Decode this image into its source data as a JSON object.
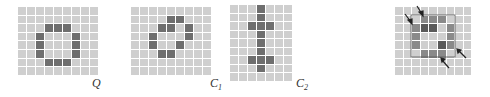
{
  "panels": [
    {
      "id": "Q",
      "label": "Q",
      "label_sub": "",
      "cols": 9,
      "rows": 8,
      "on_cells": [
        [
          2,
          3
        ],
        [
          2,
          4
        ],
        [
          2,
          5
        ],
        [
          3,
          2
        ],
        [
          3,
          6
        ],
        [
          4,
          2
        ],
        [
          4,
          6
        ],
        [
          5,
          2
        ],
        [
          5,
          6
        ],
        [
          6,
          3
        ],
        [
          6,
          4
        ],
        [
          6,
          5
        ]
      ]
    },
    {
      "id": "C1",
      "label": "C",
      "label_sub": "1",
      "cols": 9,
      "rows": 8,
      "on_cells": [
        [
          1,
          4
        ],
        [
          1,
          5
        ],
        [
          2,
          3
        ],
        [
          2,
          4
        ],
        [
          2,
          6
        ],
        [
          3,
          2
        ],
        [
          3,
          6
        ],
        [
          4,
          2
        ],
        [
          4,
          5
        ],
        [
          5,
          3
        ],
        [
          5,
          4
        ]
      ]
    },
    {
      "id": "C2",
      "label": "C",
      "label_sub": "2",
      "cols": 7,
      "rows": 9,
      "on_cells": [
        [
          0,
          3
        ],
        [
          1,
          3
        ],
        [
          2,
          2
        ],
        [
          2,
          3
        ],
        [
          2,
          4
        ],
        [
          3,
          3
        ],
        [
          4,
          3
        ],
        [
          5,
          3
        ],
        [
          6,
          2
        ],
        [
          6,
          3
        ],
        [
          6,
          4
        ],
        [
          7,
          3
        ]
      ]
    },
    {
      "id": "overlay",
      "label": "",
      "label_sub": "",
      "cols": 9,
      "rows": 8,
      "q_cells": [
        [
          1,
          3
        ],
        [
          1,
          4
        ],
        [
          1,
          5
        ],
        [
          2,
          2
        ],
        [
          2,
          6
        ],
        [
          3,
          2
        ],
        [
          3,
          6
        ],
        [
          4,
          2
        ],
        [
          4,
          6
        ],
        [
          5,
          3
        ],
        [
          5,
          4
        ],
        [
          5,
          5
        ]
      ],
      "c_cells": [
        [
          2,
          3
        ],
        [
          2,
          4
        ],
        [
          4,
          5
        ]
      ],
      "arrows": 4
    }
  ],
  "colors": {
    "cell_off": "#cfcfcf",
    "cell_on": "#6e6e6e",
    "overlay_q": "#8a8a8a",
    "overlay_c": "#5a5a5a",
    "arrow": "#222222"
  }
}
